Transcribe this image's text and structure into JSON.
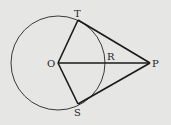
{
  "diagram": {
    "type": "geometry",
    "background": "#e6e6e4",
    "stroke_color": "#1a1a1a",
    "circle": {
      "center": "O",
      "cx": 58,
      "cy": 63,
      "r": 47
    },
    "points": {
      "O": {
        "label": "O",
        "x": 58,
        "y": 63
      },
      "T": {
        "label": "T",
        "x": 78,
        "y": 20
      },
      "S": {
        "label": "S",
        "x": 78,
        "y": 104
      },
      "P": {
        "label": "P",
        "x": 150,
        "y": 63
      },
      "R": {
        "label": "R",
        "x": 105,
        "y": 63
      }
    },
    "segments": [
      "OT",
      "OS",
      "OP",
      "TP",
      "SP"
    ]
  }
}
